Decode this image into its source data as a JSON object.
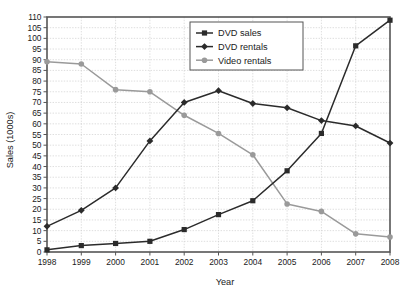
{
  "chart_data": {
    "type": "line",
    "title": "",
    "xlabel": "Year",
    "ylabel": "Sales (1000s)",
    "categories": [
      "1998",
      "1999",
      "2000",
      "2001",
      "2002",
      "2003",
      "2004",
      "2005",
      "2006",
      "2007",
      "2008"
    ],
    "x": [
      1998,
      1999,
      2000,
      2001,
      2002,
      2003,
      2004,
      2005,
      2006,
      2007,
      2008
    ],
    "xlim": [
      1998,
      2008
    ],
    "ylim": [
      0,
      110
    ],
    "ytick_step": 5,
    "yticks": [
      0,
      5,
      10,
      15,
      20,
      25,
      30,
      35,
      40,
      45,
      50,
      55,
      60,
      65,
      70,
      75,
      80,
      85,
      90,
      95,
      100,
      105,
      110
    ],
    "grid": true,
    "legend_position": "top-center-right",
    "series": [
      {
        "name": "DVD sales",
        "marker": "square",
        "color": "#2b2b2b",
        "values": [
          1,
          3,
          4,
          5,
          10.5,
          17.5,
          24,
          38,
          55.5,
          96.5,
          108.5
        ]
      },
      {
        "name": "DVD rentals",
        "marker": "diamond",
        "color": "#2b2b2b",
        "values": [
          12,
          19.5,
          30,
          52,
          70,
          75.5,
          69.5,
          67.5,
          61.5,
          59,
          51
        ]
      },
      {
        "name": "Video rentals",
        "marker": "circle",
        "color": "#9a9a9a",
        "values": [
          89,
          88,
          76,
          75,
          64,
          55.5,
          45.5,
          22.5,
          19,
          8.5,
          7
        ]
      }
    ]
  },
  "legend": {
    "items": [
      {
        "label": "DVD sales"
      },
      {
        "label": "DVD rentals"
      },
      {
        "label": "Video rentals"
      }
    ]
  },
  "axes": {
    "x_title": "Year",
    "y_title": "Sales (1000s)"
  },
  "colors": {
    "dark_series": "#2b2b2b",
    "gray_series": "#9a9a9a",
    "frame": "#555555",
    "grid": "#c8c8c8",
    "text": "#1a1a1a",
    "background": "#ffffff"
  }
}
